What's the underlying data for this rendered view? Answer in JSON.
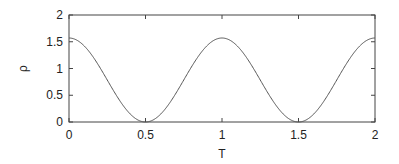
{
  "chart_data": {
    "type": "line",
    "title": "",
    "xlabel": "T",
    "ylabel": "ρ",
    "xlim": [
      0,
      2
    ],
    "ylim": [
      0,
      2
    ],
    "xticks": [
      0,
      0.5,
      1,
      1.5,
      2
    ],
    "xtick_labels": [
      "0",
      "0.5",
      "1",
      "1.5",
      "2"
    ],
    "yticks": [
      0,
      0.5,
      1,
      1.5,
      2
    ],
    "ytick_labels": [
      "0",
      "0.5",
      "1",
      "1.5",
      "2"
    ],
    "grid": false,
    "legend": null,
    "series": [
      {
        "name": "rho",
        "color": "#555555",
        "x": [
          0,
          0.1,
          0.2,
          0.25,
          0.3,
          0.4,
          0.5,
          0.6,
          0.7,
          0.75,
          0.8,
          0.9,
          1.0,
          1.1,
          1.2,
          1.25,
          1.3,
          1.4,
          1.5,
          1.6,
          1.7,
          1.75,
          1.8,
          1.9,
          2.0
        ],
        "y": [
          1.57,
          1.42,
          1.03,
          0.785,
          0.54,
          0.15,
          0.0,
          0.15,
          0.54,
          0.785,
          1.03,
          1.42,
          1.57,
          1.42,
          1.03,
          0.785,
          0.54,
          0.15,
          0.0,
          0.15,
          0.54,
          0.785,
          1.03,
          1.42,
          1.57
        ]
      }
    ]
  },
  "plot": {
    "frame": {
      "left": 69,
      "top": 15,
      "right": 375,
      "bottom": 122
    },
    "frame_color": "#444444",
    "curve_color": "#555555"
  }
}
